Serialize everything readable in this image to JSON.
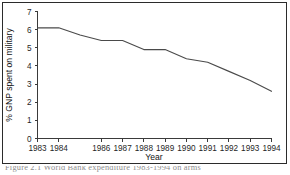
{
  "figure": {
    "caption": "Figure 2.1  World Bank expenditure 1983-1994 on arms"
  },
  "chart_data": {
    "type": "line",
    "title": "",
    "xlabel": "Year",
    "ylabel": "% GNP spent on military",
    "x": [
      1983,
      1984,
      1985,
      1986,
      1987,
      1988,
      1989,
      1990,
      1991,
      1992,
      1993,
      1994
    ],
    "values": [
      6.1,
      6.1,
      5.7,
      5.4,
      5.4,
      4.9,
      4.9,
      4.4,
      4.2,
      3.7,
      3.2,
      2.6
    ],
    "series": [
      {
        "name": "% GNP spent on military",
        "values": [
          6.1,
          6.1,
          5.7,
          5.4,
          5.4,
          4.9,
          4.9,
          4.4,
          4.2,
          3.7,
          3.2,
          2.6
        ],
        "color": "#4a4a4a"
      }
    ],
    "xtick_labels": [
      "1983",
      "1984",
      "1986",
      "1987",
      "1988",
      "1989",
      "1990",
      "1991",
      "1992",
      "1993",
      "1994"
    ],
    "xtick_values": [
      1983,
      1984,
      1986,
      1987,
      1988,
      1989,
      1990,
      1991,
      1992,
      1993,
      1994
    ],
    "ytick_labels": [
      "0",
      "1",
      "2",
      "3",
      "4",
      "5",
      "6",
      "7"
    ],
    "ytick_values": [
      0,
      1,
      2,
      3,
      4,
      5,
      6,
      7
    ],
    "xlim": [
      1983,
      1994
    ],
    "ylim": [
      0,
      7
    ],
    "grid": false,
    "legend": false,
    "legend_position": "none",
    "line_color": "#4a4a4a",
    "axis_color": "#3a3a3a",
    "background": "#ffffff"
  }
}
